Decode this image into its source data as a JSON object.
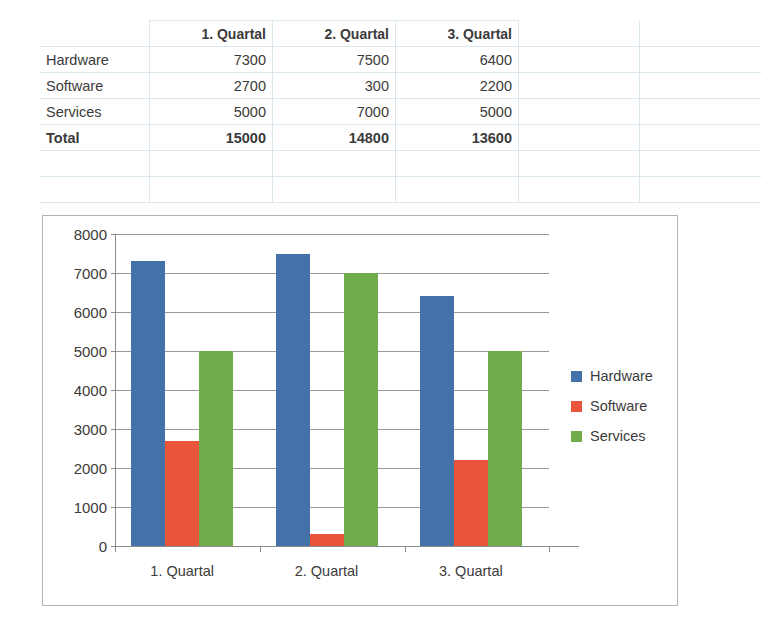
{
  "sheet": {
    "corner_label": "",
    "headers": [
      "",
      "1. Quartal",
      "2. Quartal",
      "3. Quartal",
      "",
      ""
    ],
    "rows": [
      {
        "label": "Hardware",
        "values": [
          "7300",
          "7500",
          "6400"
        ],
        "bold": false
      },
      {
        "label": "Software",
        "values": [
          "2700",
          "300",
          "2200"
        ],
        "bold": false
      },
      {
        "label": "Services",
        "values": [
          "5000",
          "7000",
          "5000"
        ],
        "bold": false
      },
      {
        "label": "Total",
        "values": [
          "15000",
          "14800",
          "13600"
        ],
        "bold": true
      }
    ],
    "empty_row_count": 2
  },
  "chart_data": {
    "type": "bar",
    "title": "",
    "xlabel": "",
    "ylabel": "",
    "categories": [
      "1. Quartal",
      "2. Quartal",
      "3. Quartal"
    ],
    "series": [
      {
        "name": "Hardware",
        "color": "#4472a8",
        "values": [
          7300,
          7500,
          6400
        ]
      },
      {
        "name": "Software",
        "color": "#e8553a",
        "values": [
          2700,
          300,
          2200
        ]
      },
      {
        "name": "Services",
        "color": "#70ab4c",
        "values": [
          5000,
          7000,
          5000
        ]
      }
    ],
    "ylim": [
      0,
      8000
    ],
    "yticks": [
      0,
      1000,
      2000,
      3000,
      4000,
      5000,
      6000,
      7000,
      8000
    ],
    "ytick_labels": [
      "0",
      "1000",
      "2000",
      "3000",
      "4000",
      "5000",
      "6000",
      "7000",
      "8000"
    ],
    "grid": true,
    "legend_position": "right"
  },
  "colors": {
    "hardware": "#4472a8",
    "software": "#e8553a",
    "services": "#70ab4c",
    "grid": "#9a9a9a",
    "axis": "#8a8a8a",
    "cell_border": "#dbe7ee",
    "chart_border": "#b4b4b4"
  }
}
